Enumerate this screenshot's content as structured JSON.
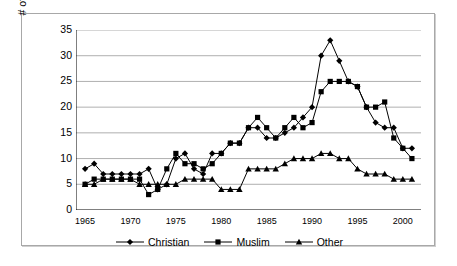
{
  "chart_data": {
    "type": "line",
    "title": "",
    "xlabel": "",
    "ylabel": "# of State Failures",
    "xlim": [
      1964,
      2002
    ],
    "ylim": [
      0,
      35
    ],
    "ystep": 5,
    "grid": "horizontal",
    "legend_position": "bottom",
    "x": [
      1965,
      1966,
      1967,
      1968,
      1969,
      1970,
      1971,
      1972,
      1973,
      1974,
      1975,
      1976,
      1977,
      1978,
      1979,
      1980,
      1981,
      1982,
      1983,
      1984,
      1985,
      1986,
      1987,
      1988,
      1989,
      1990,
      1991,
      1992,
      1993,
      1994,
      1995,
      1996,
      1997,
      1998,
      1999,
      2000,
      2001
    ],
    "x_tick_labels": [
      "1965",
      "1970",
      "1975",
      "1980",
      "1985",
      "1990",
      "1995",
      "2000"
    ],
    "x_tick_values": [
      1965,
      1970,
      1975,
      1980,
      1985,
      1990,
      1995,
      2000
    ],
    "y_tick_labels": [
      "0",
      "5",
      "10",
      "15",
      "20",
      "25",
      "30",
      "35"
    ],
    "y_tick_values": [
      0,
      5,
      10,
      15,
      20,
      25,
      30,
      35
    ],
    "series": [
      {
        "name": "Christian",
        "marker": "diamond",
        "color": "#000000",
        "values": [
          8,
          9,
          7,
          7,
          7,
          7,
          7,
          8,
          4,
          5,
          10,
          11,
          8,
          7,
          11,
          11,
          13,
          13,
          16,
          16,
          14,
          14,
          15,
          16,
          18,
          20,
          30,
          33,
          29,
          25,
          24,
          20,
          17,
          16,
          16,
          12,
          12
        ]
      },
      {
        "name": "Muslim",
        "marker": "square",
        "color": "#000000",
        "values": [
          5,
          6,
          6,
          6,
          6,
          6,
          6,
          3,
          4,
          8,
          11,
          9,
          9,
          8,
          9,
          11,
          13,
          13,
          16,
          18,
          16,
          14,
          16,
          18,
          16,
          17,
          23,
          25,
          25,
          25,
          24,
          20,
          20,
          21,
          14,
          12,
          10
        ]
      },
      {
        "name": "Other",
        "marker": "triangle",
        "color": "#000000",
        "values": [
          5,
          5,
          6,
          6,
          6,
          6,
          5,
          5,
          5,
          5,
          5,
          6,
          6,
          6,
          6,
          4,
          4,
          4,
          8,
          8,
          8,
          8,
          9,
          10,
          10,
          10,
          11,
          11,
          10,
          10,
          8,
          7,
          7,
          7,
          6,
          6,
          6
        ]
      }
    ]
  },
  "legend": {
    "items": [
      {
        "label": "Christian",
        "marker": "diamond"
      },
      {
        "label": "Muslim",
        "marker": "square"
      },
      {
        "label": "Other",
        "marker": "triangle"
      }
    ]
  },
  "axes": {
    "y_title": "# of State Failures"
  },
  "style": {
    "gridline_color": "#9a9a9a",
    "axis_color": "#000000",
    "frame_color": "#a8a8a8",
    "background": "#ffffff",
    "series_color": "#000000"
  }
}
